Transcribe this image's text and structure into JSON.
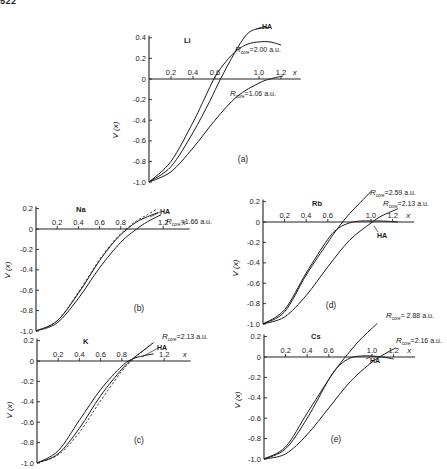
{
  "page": {
    "number": "522"
  },
  "figure": {
    "y_axis_label": "V (x)",
    "x_axis_label": "x"
  },
  "chart_data": [
    {
      "id": "a",
      "type": "line",
      "element": "Li",
      "panel_label": "(a)",
      "xlabel": "x",
      "ylabel": "V (x)",
      "x_ticks": [
        "0.2",
        "0.4",
        "0.6",
        "1.0",
        "1.2"
      ],
      "y_ticks": [
        "0.4",
        "0.2",
        "0",
        "-0.2",
        "-0.4",
        "-0.6",
        "-0.8",
        "-1.0"
      ],
      "xlim": [
        0,
        1.3
      ],
      "ylim": [
        -1.0,
        0.45
      ],
      "grid": false,
      "series": [
        {
          "name": "HA",
          "label": "HA",
          "style": "solid",
          "x": [
            0,
            0.2,
            0.4,
            0.55,
            0.65,
            0.75,
            0.85,
            0.92,
            1.0,
            1.1
          ],
          "y": [
            -1.0,
            -0.85,
            -0.52,
            -0.22,
            0.0,
            0.2,
            0.38,
            0.46,
            0.49,
            0.5
          ]
        },
        {
          "name": "R_core = 2.00 a.u.",
          "label": "R",
          "sub": "core",
          "value": "=2.00 a.u.",
          "style": "solid",
          "x": [
            0,
            0.2,
            0.4,
            0.5,
            0.6,
            0.7,
            0.8,
            0.9,
            1.0,
            1.1,
            1.2
          ],
          "y": [
            -1.0,
            -0.8,
            -0.42,
            -0.2,
            0.02,
            0.17,
            0.28,
            0.34,
            0.36,
            0.36,
            0.33
          ]
        },
        {
          "name": "R_core = 1.06 a.u.",
          "label": "R",
          "sub": "core",
          "value": "=1.06 a.u.",
          "style": "solid",
          "x": [
            0,
            0.2,
            0.4,
            0.6,
            0.8,
            1.0,
            1.1,
            1.22
          ],
          "y": [
            -1.0,
            -0.9,
            -0.67,
            -0.4,
            -0.17,
            -0.04,
            0.0,
            0.03
          ]
        }
      ]
    },
    {
      "id": "b",
      "type": "line",
      "element": "Na",
      "panel_label": "(b)",
      "xlabel": "x",
      "ylabel": "V (x)",
      "x_ticks": [
        "0.2",
        "0.4",
        "0.6",
        "0.8",
        "1.2"
      ],
      "y_ticks": [
        "0.2",
        "0",
        "-0.2",
        "-0.4",
        "-0.6",
        "-0.8",
        "-1.0"
      ],
      "xlim": [
        0,
        1.4
      ],
      "ylim": [
        -1.0,
        0.22
      ],
      "grid": false,
      "series": [
        {
          "name": "HA",
          "label": "HA",
          "style": "dashed",
          "x": [
            0,
            0.2,
            0.4,
            0.6,
            0.75,
            0.85,
            0.95,
            1.05,
            1.15
          ],
          "y": [
            -1.0,
            -0.9,
            -0.62,
            -0.3,
            -0.1,
            0.0,
            0.08,
            0.14,
            0.2
          ]
        },
        {
          "name": "HA (solid)",
          "style": "solid",
          "x": [
            0,
            0.2,
            0.4,
            0.6,
            0.75,
            0.85,
            0.95,
            1.05,
            1.15
          ],
          "y": [
            -1.0,
            -0.9,
            -0.63,
            -0.31,
            -0.11,
            -0.01,
            0.07,
            0.12,
            0.16
          ]
        },
        {
          "name": "R_core = 1.66 a.u.",
          "label": "R",
          "sub": "core",
          "value": "=1.66 a.u.",
          "style": "solid",
          "x": [
            0,
            0.2,
            0.4,
            0.6,
            0.8,
            0.95,
            1.05,
            1.18
          ],
          "y": [
            -1.0,
            -0.92,
            -0.68,
            -0.38,
            -0.13,
            0.0,
            0.07,
            0.14
          ]
        }
      ]
    },
    {
      "id": "c",
      "type": "line",
      "element": "K",
      "panel_label": "(c)",
      "xlabel": "x",
      "ylabel": "V (x)",
      "x_ticks": [
        "0.2",
        "0.4",
        "0.6",
        "0.8",
        "1.2"
      ],
      "y_ticks": [
        "0.2",
        "0",
        "-0.2",
        "-0.4",
        "-0.6",
        "-0.8",
        "-1.0"
      ],
      "xlim": [
        0,
        1.4
      ],
      "ylim": [
        -1.0,
        0.22
      ],
      "grid": false,
      "series": [
        {
          "name": "R_core = 2.13 a.u.",
          "label": "R",
          "sub": "core",
          "value": "=2.13 a.u.",
          "style": "solid",
          "x": [
            0,
            0.2,
            0.4,
            0.6,
            0.8,
            0.9,
            1.0,
            1.1
          ],
          "y": [
            -1.0,
            -0.91,
            -0.66,
            -0.34,
            -0.08,
            0.02,
            0.1,
            0.18
          ]
        },
        {
          "name": "HA (dashed)",
          "style": "dashed",
          "x": [
            0,
            0.2,
            0.4,
            0.6,
            0.8,
            0.9,
            1.0,
            1.08
          ],
          "y": [
            -1.0,
            -0.92,
            -0.7,
            -0.39,
            -0.1,
            0.01,
            0.1,
            0.17
          ]
        },
        {
          "name": "HA",
          "label": "HA",
          "style": "solid",
          "x": [
            0,
            0.2,
            0.4,
            0.6,
            0.8,
            0.9,
            1.0,
            1.1
          ],
          "y": [
            -1.0,
            -0.88,
            -0.58,
            -0.28,
            -0.05,
            0.02,
            0.05,
            0.07
          ]
        }
      ]
    },
    {
      "id": "d",
      "type": "line",
      "element": "Rb",
      "panel_label": "(d)",
      "xlabel": "x",
      "ylabel": "V (x)",
      "x_ticks": [
        "0.2",
        "0.4",
        "0.6",
        "1.0",
        "1.2"
      ],
      "y_ticks": [
        "0.2",
        "0",
        "-0.2",
        "-0.4",
        "-0.6",
        "-0.8",
        "-1.0"
      ],
      "xlim": [
        0,
        1.4
      ],
      "ylim": [
        -1.0,
        0.22
      ],
      "grid": false,
      "series": [
        {
          "name": "R_core = 2.59 a.u.",
          "label": "R",
          "sub": "core",
          "value": "=2.59 a.u.",
          "style": "solid",
          "x": [
            0,
            0.2,
            0.4,
            0.6,
            0.7,
            0.8,
            0.9,
            1.0
          ],
          "y": [
            -1.0,
            -0.88,
            -0.52,
            -0.2,
            -0.05,
            0.08,
            0.19,
            0.3
          ]
        },
        {
          "name": "HA",
          "label": "HA",
          "style": "solid",
          "x": [
            0,
            0.2,
            0.4,
            0.6,
            0.7,
            0.8,
            0.9,
            1.0,
            1.1,
            1.25
          ],
          "y": [
            -1.0,
            -0.86,
            -0.5,
            -0.17,
            -0.06,
            -0.01,
            0.01,
            0.01,
            0.01,
            0.0
          ]
        },
        {
          "name": "R_core = 2.13 a.u.",
          "label": "R",
          "sub": "core",
          "value": "=2.13 a.u.",
          "style": "solid",
          "x": [
            0,
            0.2,
            0.4,
            0.6,
            0.8,
            1.0,
            1.1,
            1.25
          ],
          "y": [
            -1.0,
            -0.93,
            -0.72,
            -0.44,
            -0.18,
            -0.01,
            0.06,
            0.13
          ]
        }
      ]
    },
    {
      "id": "e",
      "type": "line",
      "element": "Cs",
      "panel_label": "(e)",
      "xlabel": "x",
      "ylabel": "V (x)",
      "x_ticks": [
        "0.2",
        "0.4",
        "0.6",
        "1.0",
        "1.2"
      ],
      "y_ticks": [
        "0.2",
        "0",
        "-0.2",
        "-0.4",
        "-0.6",
        "-0.8",
        "-1.0"
      ],
      "xlim": [
        0,
        1.4
      ],
      "ylim": [
        -1.0,
        0.22
      ],
      "grid": false,
      "series": [
        {
          "name": "R_core = 2.88 a.u.",
          "label": "R",
          "sub": "core",
          "value": "= 2.88 a.u.",
          "style": "solid",
          "x": [
            0,
            0.2,
            0.4,
            0.6,
            0.7,
            0.8,
            0.9,
            1.05
          ],
          "y": [
            -1.0,
            -0.88,
            -0.55,
            -0.22,
            -0.07,
            0.06,
            0.18,
            0.33
          ]
        },
        {
          "name": "HA",
          "label": "HA",
          "style": "solid",
          "x": [
            0,
            0.2,
            0.4,
            0.6,
            0.7,
            0.8,
            0.9,
            1.0,
            1.1,
            1.2
          ],
          "y": [
            -1.0,
            -0.9,
            -0.6,
            -0.22,
            -0.08,
            -0.01,
            0.01,
            0.01,
            0.0,
            -0.02
          ]
        },
        {
          "name": "R_core = 2.16 a.u.",
          "label": "R",
          "sub": "core",
          "value": "=2.16 a.u.",
          "style": "solid",
          "x": [
            0,
            0.2,
            0.4,
            0.6,
            0.8,
            1.0,
            1.1,
            1.22
          ],
          "y": [
            -1.0,
            -0.95,
            -0.76,
            -0.5,
            -0.24,
            -0.05,
            0.02,
            0.09
          ]
        }
      ]
    }
  ]
}
